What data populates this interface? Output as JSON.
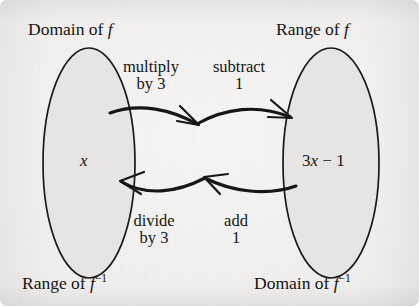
{
  "figure": {
    "kind": "function-machine-mapping-diagram",
    "background_color": "#f0efed",
    "ink_color": "#141414",
    "ellipse_fill": "#e6e5e3",
    "ellipse_stroke": "#1a1a1a"
  },
  "corner_labels": {
    "top_left": {
      "text": "Domain of",
      "symbol": "f",
      "exponent": ""
    },
    "top_right": {
      "text": "Range of",
      "symbol": "f",
      "exponent": ""
    },
    "bottom_left": {
      "text": "Range of",
      "symbol": "f",
      "exponent": "−1"
    },
    "bottom_right": {
      "text": "Domain of",
      "symbol": "f",
      "exponent": "−1"
    }
  },
  "sets": {
    "left": {
      "element_prefix": "",
      "element": "x",
      "element_suffix": ""
    },
    "right": {
      "coefficient": "3",
      "variable": "x",
      "operator": "−",
      "constant": "1"
    }
  },
  "operations": {
    "forward": [
      {
        "line1": "multiply",
        "line2": "by 3"
      },
      {
        "line1": "subtract",
        "line2": "1"
      }
    ],
    "inverse": [
      {
        "line1": "divide",
        "line2": "by 3"
      },
      {
        "line1": "add",
        "line2": "1"
      }
    ]
  },
  "arrows": {
    "forward": {
      "direction": "right",
      "label": "forward-arrow"
    },
    "inverse": {
      "direction": "left",
      "label": "inverse-arrow"
    }
  }
}
